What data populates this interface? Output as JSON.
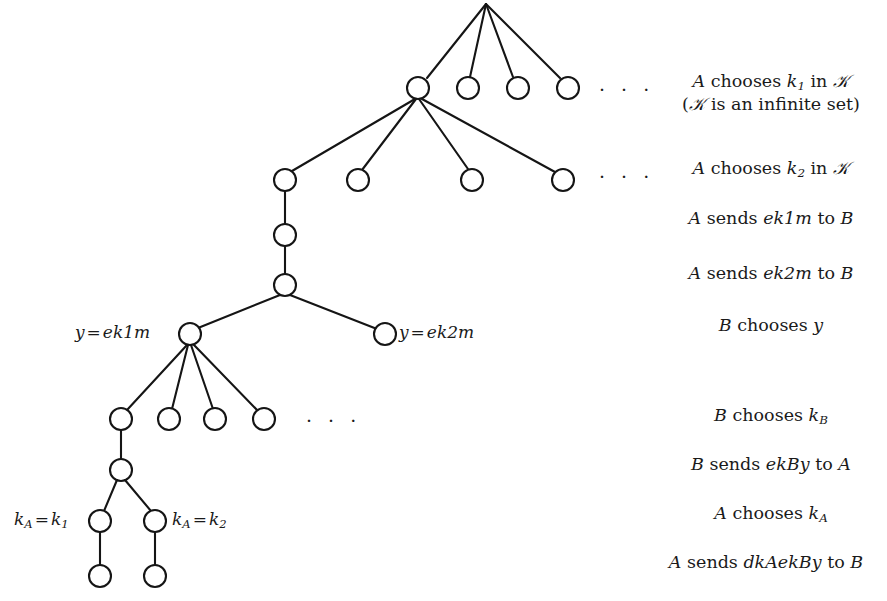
{
  "figure": {
    "background_color": "#ffffff",
    "stroke_color": "#151515"
  },
  "tree_labels": {
    "y_eq_ek1m": "y = ek1m",
    "y_eq_ek2m": "y = ek2m",
    "kA_eq_k1": "k_A = k_1",
    "kA_eq_k2": "k_A = k_2"
  },
  "ellipses": {
    "level1": "· · ·",
    "level2": "· · ·",
    "level3": "· · ·"
  },
  "annotations": [
    {
      "id": "a-chooses-k1",
      "line1": "A chooses k₁ in 𝒦",
      "line2": "(𝒦 is an infinite set)",
      "y": 78
    },
    {
      "id": "a-chooses-k2",
      "line1": "A chooses k₂ in 𝒦",
      "line2": "",
      "y": 165
    },
    {
      "id": "a-sends-ek1m",
      "line1": "A sends ek1m to B",
      "line2": "",
      "y": 215
    },
    {
      "id": "a-sends-ek2m",
      "line1": "A sends ek2m to B",
      "line2": "",
      "y": 270
    },
    {
      "id": "b-chooses-y",
      "line1": "B chooses y",
      "line2": "",
      "y": 322
    },
    {
      "id": "b-chooses-kb",
      "line1": "B chooses k_B",
      "line2": "",
      "y": 412
    },
    {
      "id": "b-sends-ekby",
      "line1": "B sends ekBy to A",
      "line2": "",
      "y": 461
    },
    {
      "id": "a-chooses-ka",
      "line1": "A chooses k_A",
      "line2": "",
      "y": 510
    },
    {
      "id": "a-sends-dkaekby",
      "line1": "A sends dkAekBy to B",
      "line2": "",
      "y": 559
    }
  ],
  "nodes": {
    "root": {
      "x": 486,
      "y": 4,
      "shape": "vertex"
    },
    "level1": [
      {
        "x": 418,
        "y": 88
      },
      {
        "x": 468,
        "y": 88
      },
      {
        "x": 518,
        "y": 88
      },
      {
        "x": 568,
        "y": 88
      }
    ],
    "level2": [
      {
        "x": 285,
        "y": 180
      },
      {
        "x": 358,
        "y": 180
      },
      {
        "x": 472,
        "y": 180
      },
      {
        "x": 563,
        "y": 180
      }
    ],
    "chain": [
      {
        "x": 285,
        "y": 235
      },
      {
        "x": 285,
        "y": 285
      }
    ],
    "y_split": [
      {
        "x": 190,
        "y": 334,
        "label": "y = ek1m"
      },
      {
        "x": 385,
        "y": 334,
        "label": "y = ek2m"
      }
    ],
    "level4": [
      {
        "x": 121,
        "y": 419
      },
      {
        "x": 169,
        "y": 419
      },
      {
        "x": 215,
        "y": 419
      },
      {
        "x": 264,
        "y": 419
      }
    ],
    "chain2": [
      {
        "x": 121,
        "y": 470
      }
    ],
    "ka_split": [
      {
        "x": 100,
        "y": 521,
        "label": "k_A = k_1"
      },
      {
        "x": 155,
        "y": 521,
        "label": "k_A = k_2"
      }
    ],
    "leaves": [
      {
        "x": 100,
        "y": 576
      },
      {
        "x": 155,
        "y": 576
      }
    ]
  }
}
